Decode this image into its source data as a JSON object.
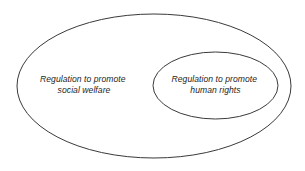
{
  "diagram": {
    "type": "euler-venn",
    "background_color": "#ffffff",
    "stroke_color": "#3a3a3a",
    "text_color": "#262626",
    "sets": [
      {
        "id": "outer-set",
        "name": "social-welfare-set",
        "label_line1": "Regulation to promote",
        "label_line2": "social welfare",
        "relation": "contains human rights set",
        "cx": 154,
        "cy": 86,
        "rx": 137,
        "ry": 72,
        "label_x": 84,
        "label_y1": 82,
        "label_y2": 93
      },
      {
        "id": "inner-set",
        "name": "human-rights-set",
        "label_line1": "Regulation to promote",
        "label_line2": "human rights",
        "relation": "subset of social welfare set",
        "cx": 215.5,
        "cy": 85.5,
        "rx": 62.5,
        "ry": 33.5,
        "label_x": 215.5,
        "label_y1": 82,
        "label_y2": 93
      }
    ]
  }
}
